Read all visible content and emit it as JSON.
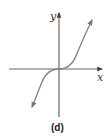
{
  "diagram": {
    "caption": "(d)",
    "x_axis_label": "x",
    "y_axis_label": "y",
    "curve_description": "cubic-like curve y = x^3 passing through origin, increasing, arrows at both ends",
    "colors": {
      "axis": "#555555",
      "curve": "#7a7a7a",
      "text": "#222222"
    }
  }
}
